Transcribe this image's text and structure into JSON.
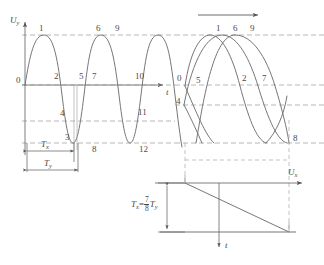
{
  "figure": {
    "colors": {
      "curve": "#6b6b6b",
      "axis": "#555555",
      "dashed": "#8f8f8f",
      "text": "#4a4a4a",
      "background": "#ffffff"
    }
  },
  "axes": {
    "left_plot": {
      "y_axis_label": "U",
      "y_axis_sub": "y",
      "x_axis_label": "t"
    },
    "right_plot": {
      "x_axis_label": "U",
      "x_axis_sub": "x"
    },
    "sweep_plot": {
      "axis_label": "t"
    }
  },
  "left_plot": {
    "name": "uy-vs-t-waveform",
    "point_labels_top": [
      "1",
      "6",
      "9"
    ],
    "point_labels_zero": [
      "0",
      "2",
      "5",
      "7",
      "10"
    ],
    "point_labels_lower": [
      "4",
      "11"
    ],
    "point_labels_bottom": [
      "3",
      "8",
      "12"
    ],
    "all_points": [
      "0",
      "1",
      "2",
      "3",
      "4",
      "5",
      "6",
      "7",
      "8",
      "9",
      "10",
      "11",
      "12"
    ],
    "brackets": [
      {
        "label": "T",
        "sub": "x",
        "name": "tx-bracket"
      },
      {
        "label": "T",
        "sub": "y",
        "name": "ty-bracket"
      }
    ]
  },
  "right_plot": {
    "name": "lissajous-screen-trace",
    "point_labels_top": [
      "1",
      "6",
      "9"
    ],
    "point_labels_middle_left": [
      "0",
      "5"
    ],
    "point_labels_middle_right": [
      "2",
      "7"
    ],
    "point_labels_lower_left": [
      "4"
    ],
    "point_labels_bottom_right": [
      "8"
    ],
    "direction_arrow": "sweep-direction-arrow"
  },
  "sweep_plot": {
    "name": "sawtooth-sweep",
    "period_bracket": {
      "lhs": "T",
      "lhs_sub": "x",
      "equals": "=",
      "numerator": "7",
      "denominator": "8",
      "rhs": "T",
      "rhs_sub": "y"
    },
    "time_axis_label": "t"
  },
  "relation": {
    "text": "Tx = 7/8 Ty",
    "ratio_numerator": "7",
    "ratio_denominator": "8"
  }
}
